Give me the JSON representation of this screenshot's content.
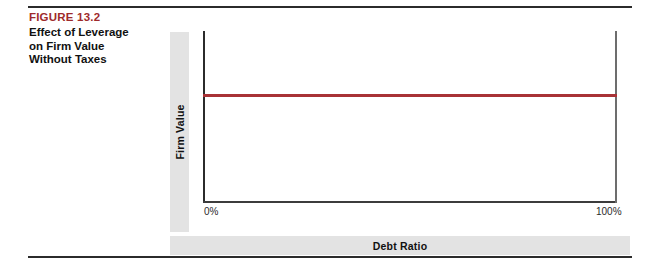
{
  "figure": {
    "number": "FIGURE 13.2",
    "title_lines": [
      "Effect of Leverage",
      "on Firm Value",
      "Without Taxes"
    ],
    "number_color": "#9e2a2b"
  },
  "chart_data": {
    "type": "line",
    "title": "Effect of Leverage on Firm Value Without Taxes",
    "xlabel": "Debt Ratio",
    "ylabel": "Firm Value",
    "x": [
      0,
      100
    ],
    "series": [
      {
        "name": "Firm Value",
        "values": [
          62,
          62
        ],
        "color": "#a83236"
      }
    ],
    "xlim": [
      0,
      100
    ],
    "ylim": [
      0,
      100
    ],
    "xticks": [
      0,
      100
    ],
    "xticklabels": [
      "0%",
      "100%"
    ],
    "yticks": [],
    "yticklabels": [],
    "grid": false,
    "legend": false,
    "annotation": "Firm value is constant and independent of the debt ratio under Modigliani-Miller Proposition I without taxes."
  },
  "axes": {
    "x_title": "Debt Ratio",
    "y_title": "Firm Value",
    "tick_min": "0%",
    "tick_max": "100%"
  }
}
